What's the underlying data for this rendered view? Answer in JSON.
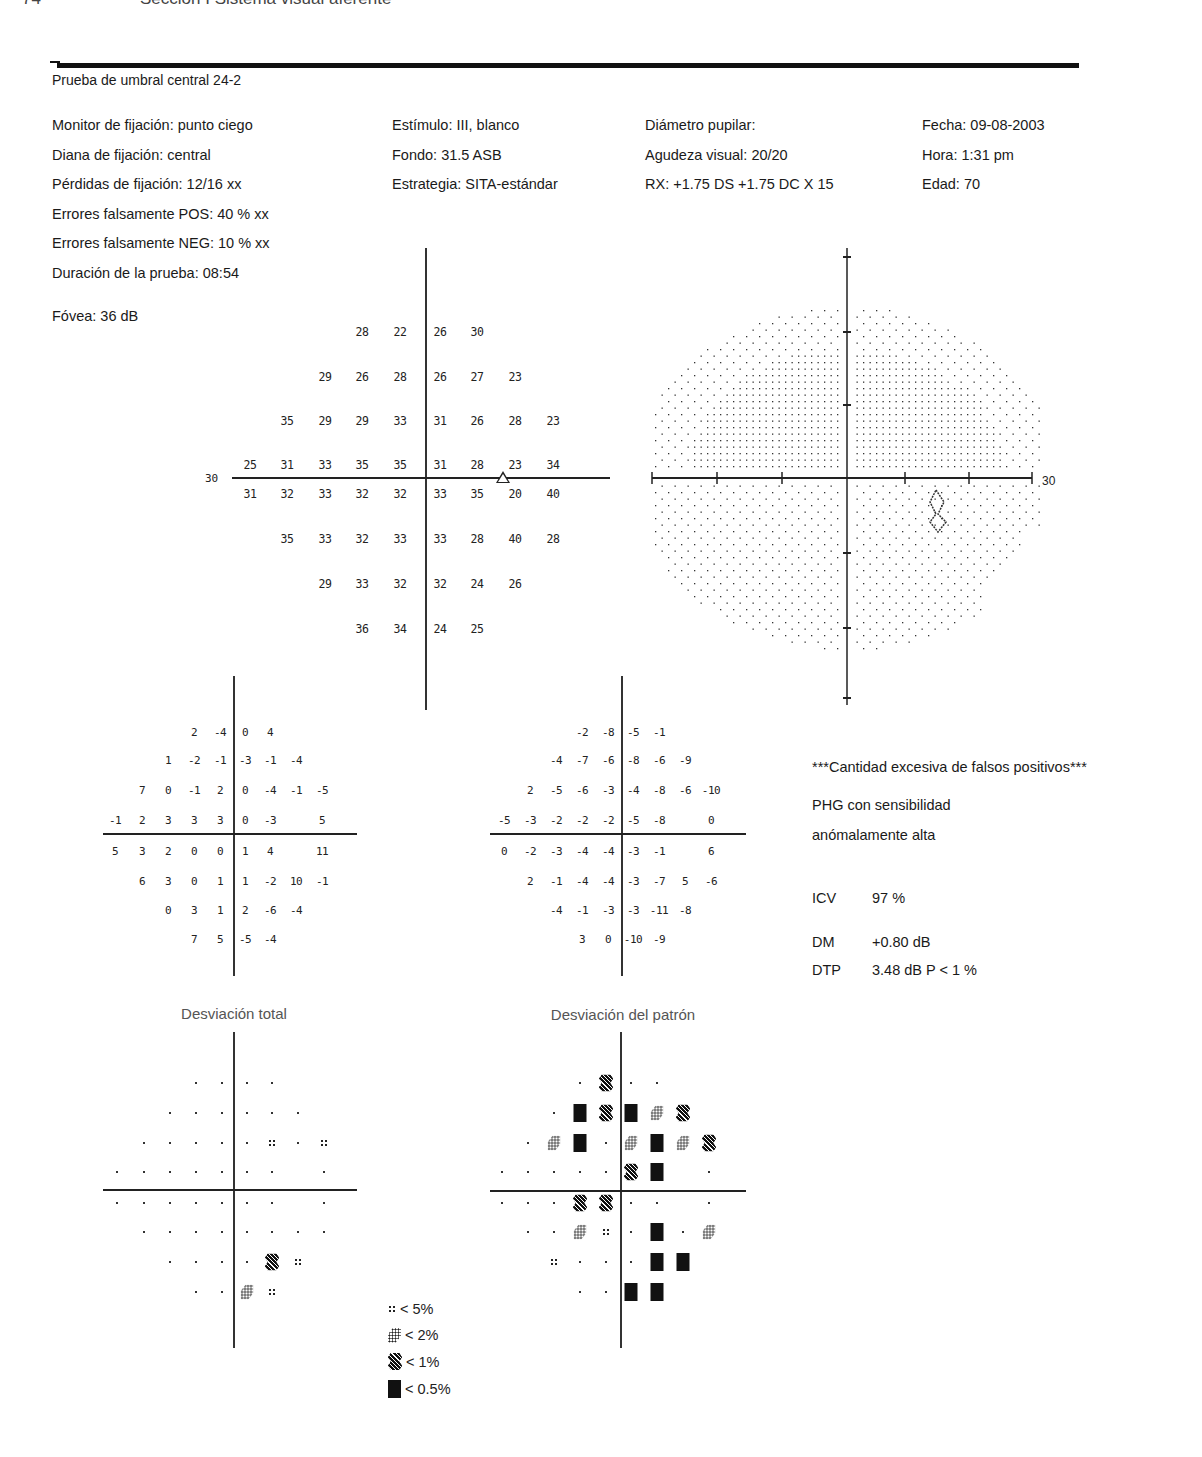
{
  "page_header": {
    "page_number": "74",
    "section": "Sección I Sistema visual aferente"
  },
  "report": {
    "title": "Prueba de umbral central 24-2",
    "info_columns": [
      [
        "Monitor de fijación: punto ciego",
        "Diana de fijación: central",
        "Pérdidas de fijación: 12/16 xx",
        "Errores falsamente POS: 40 % xx",
        "Errores falsamente NEG: 10 % xx",
        "Duración de la prueba: 08:54"
      ],
      [
        "Estímulo: III, blanco",
        "Fondo: 31.5 ASB",
        "Estrategia: SITA-estándar"
      ],
      [
        "Diámetro pupilar:",
        "Agudeza visual: 20/20",
        "RX: +1.75 DS +1.75 DC X 15"
      ],
      [
        "Fecha: 09-08-2003",
        "Hora: 1:31 pm",
        "Edad: 70"
      ]
    ],
    "fovea": "Fóvea: 36 dB"
  },
  "threshold_plot": {
    "axis_label": "30",
    "rows": [
      [
        "",
        "",
        "",
        "28",
        "22",
        "26",
        "30",
        "",
        ""
      ],
      [
        "",
        "",
        "29",
        "26",
        "28",
        "26",
        "27",
        "23",
        ""
      ],
      [
        "",
        "35",
        "29",
        "29",
        "33",
        "31",
        "26",
        "28",
        "23"
      ],
      [
        "25",
        "31",
        "33",
        "35",
        "35",
        "31",
        "28",
        "23",
        "34"
      ],
      [
        "31",
        "32",
        "33",
        "32",
        "32",
        "33",
        "35",
        "20",
        "40"
      ],
      [
        "",
        "35",
        "33",
        "32",
        "33",
        "33",
        "28",
        "40",
        "28"
      ],
      [
        "",
        "",
        "29",
        "33",
        "32",
        "32",
        "24",
        "26",
        ""
      ],
      [
        "",
        "",
        "",
        "36",
        "34",
        "24",
        "25",
        "",
        ""
      ]
    ],
    "blind_spot_marker": "triangle"
  },
  "grayscale_plot": {
    "axis_label": "30"
  },
  "total_deviation": {
    "caption": "Desviación total",
    "values": [
      [
        "",
        "",
        "",
        "2",
        "-4",
        "0",
        "4",
        "",
        ""
      ],
      [
        "",
        "",
        "1",
        "-2",
        "-1",
        "-3",
        "-1",
        "-4",
        ""
      ],
      [
        "",
        "7",
        "0",
        "-1",
        "2",
        "0",
        "-4",
        "-1",
        "-5"
      ],
      [
        "-1",
        "2",
        "3",
        "3",
        "3",
        "0",
        "-3",
        "",
        "5"
      ],
      [
        "5",
        "3",
        "2",
        "0",
        "0",
        "1",
        "4",
        "",
        "11"
      ],
      [
        "",
        "6",
        "3",
        "0",
        "1",
        "1",
        "-2",
        "10",
        "-1"
      ],
      [
        "",
        "",
        "0",
        "3",
        "1",
        "2",
        "-6",
        "-4",
        ""
      ],
      [
        "",
        "",
        "",
        "7",
        "5",
        "-5",
        "-4",
        "",
        ""
      ]
    ],
    "probability": [
      [
        "",
        "",
        "",
        ".",
        ".",
        ".",
        ".",
        "",
        ""
      ],
      [
        "",
        "",
        ".",
        ".",
        ".",
        ".",
        ".",
        ".",
        ""
      ],
      [
        "",
        ".",
        ".",
        ".",
        ".",
        ".",
        "5",
        ".",
        "5"
      ],
      [
        ".",
        ".",
        ".",
        ".",
        ".",
        ".",
        ".",
        "",
        "."
      ],
      [
        ".",
        ".",
        ".",
        ".",
        ".",
        ".",
        ".",
        "",
        "."
      ],
      [
        "",
        ".",
        ".",
        ".",
        ".",
        ".",
        ".",
        ".",
        "."
      ],
      [
        "",
        "",
        ".",
        ".",
        ".",
        ".",
        "1",
        "5",
        ""
      ],
      [
        "",
        "",
        "",
        ".",
        ".",
        "2",
        "5",
        "",
        ""
      ]
    ]
  },
  "pattern_deviation": {
    "caption": "Desviación del patrón",
    "values": [
      [
        "",
        "",
        "",
        "-2",
        "-8",
        "-5",
        "-1",
        "",
        ""
      ],
      [
        "",
        "",
        "-4",
        "-7",
        "-6",
        "-8",
        "-6",
        "-9",
        ""
      ],
      [
        "",
        "2",
        "-5",
        "-6",
        "-3",
        "-4",
        "-8",
        "-6",
        "-10"
      ],
      [
        "-5",
        "-3",
        "-2",
        "-2",
        "-2",
        "-5",
        "-8",
        "",
        "0"
      ],
      [
        "0",
        "-2",
        "-3",
        "-4",
        "-4",
        "-3",
        "-1",
        "",
        "6"
      ],
      [
        "",
        "2",
        "-1",
        "-4",
        "-4",
        "-3",
        "-7",
        "5",
        "-6"
      ],
      [
        "",
        "",
        "-4",
        "-1",
        "-3",
        "-3",
        "-11",
        "-8",
        ""
      ],
      [
        "",
        "",
        "",
        "3",
        "0",
        "-10",
        "-9",
        "",
        ""
      ]
    ],
    "probability": [
      [
        "",
        "",
        "",
        ".",
        "1",
        ".",
        ".",
        "",
        ""
      ],
      [
        "",
        "",
        ".",
        "0",
        "1",
        "0",
        "2",
        "1",
        ""
      ],
      [
        "",
        ".",
        "2",
        "0",
        ".",
        "2",
        "0",
        "2",
        "1"
      ],
      [
        ".",
        ".",
        ".",
        ".",
        ".",
        "1",
        "0",
        "",
        "."
      ],
      [
        ".",
        ".",
        ".",
        "1",
        "1",
        ".",
        ".",
        "",
        "."
      ],
      [
        "",
        ".",
        ".",
        "2",
        "5",
        ".",
        "0",
        ".",
        "2"
      ],
      [
        "",
        "",
        "5",
        ".",
        ".",
        ".",
        "0",
        "0",
        ""
      ],
      [
        "",
        "",
        "",
        ".",
        ".",
        "0",
        "0",
        "",
        ""
      ]
    ]
  },
  "legend": [
    {
      "symbol": "5",
      "label": "< 5%"
    },
    {
      "symbol": "2",
      "label": "< 2%"
    },
    {
      "symbol": "1",
      "label": "< 1%"
    },
    {
      "symbol": "0",
      "label": "< 0.5%"
    }
  ],
  "indices": {
    "warning": "***Cantidad excesiva de falsos positivos***",
    "ght_line1": "PHG con sensibilidad",
    "ght_line2": "anómalamente alta",
    "vfi_label": "ICV",
    "vfi_value": "97 %",
    "md_label": "DM",
    "md_value": "+0.80 dB",
    "psd_label": "DTP",
    "psd_value": "3.48 dB P < 1 %"
  }
}
